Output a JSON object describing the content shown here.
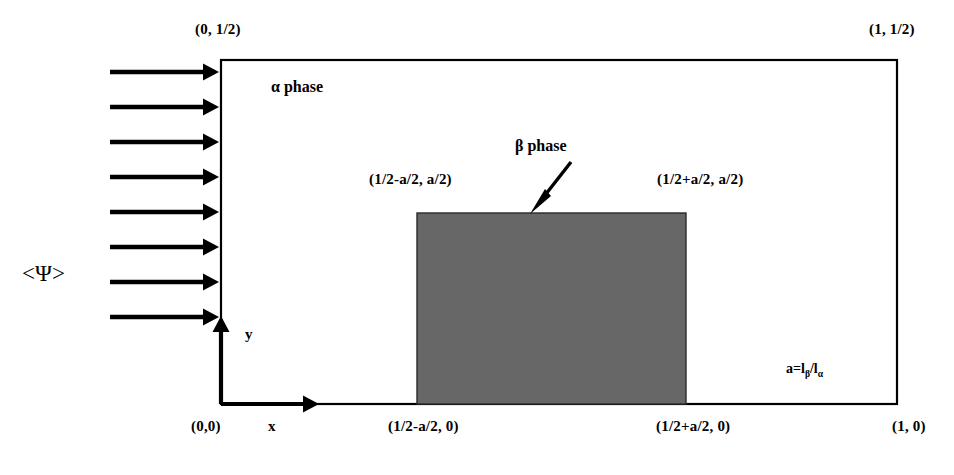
{
  "figure": {
    "background_color": "#ffffff",
    "line_color": "#000000",
    "beta_fill_color": "#676767"
  },
  "labels": {
    "corner_top_left": "(0, 1/2)",
    "corner_top_right": "(1, 1/2)",
    "corner_bottom_left": "(0,0)",
    "corner_bottom_right": "(1, 0)",
    "beta_top_left": "(1/2-a/2, a/2)",
    "beta_top_right": "(1/2+a/2, a/2)",
    "beta_bottom_left": "(1/2-a/2, 0)",
    "beta_bottom_right": "(1/2+a/2, 0)",
    "alpha_phase": "α    phase",
    "beta_phase": "β  phase",
    "flux": "<Ψ>",
    "axis_x": "x",
    "axis_y": "y",
    "ratio_prefix": "a=l",
    "ratio_sub1": "β",
    "ratio_slash": "/l",
    "ratio_sub2": "α"
  },
  "geometry": {
    "outer_rect": {
      "x": 221,
      "y": 60,
      "width": 676,
      "height": 344
    },
    "beta_rect": {
      "x": 417,
      "y": 213,
      "width": 269,
      "height": 191
    },
    "inflow_arrows": {
      "count": 8,
      "x_start": 110,
      "x_end": 216,
      "y_values": [
        72,
        107,
        142,
        177,
        212,
        247,
        282,
        317
      ]
    },
    "axis_y_arrow": {
      "x": 221,
      "y_from": 404,
      "y_to": 318
    },
    "axis_x_arrow": {
      "y": 404,
      "x_from": 221,
      "x_to": 318
    },
    "beta_pointer": {
      "x1": 570,
      "y1": 163,
      "x2": 532,
      "y2": 212
    }
  }
}
